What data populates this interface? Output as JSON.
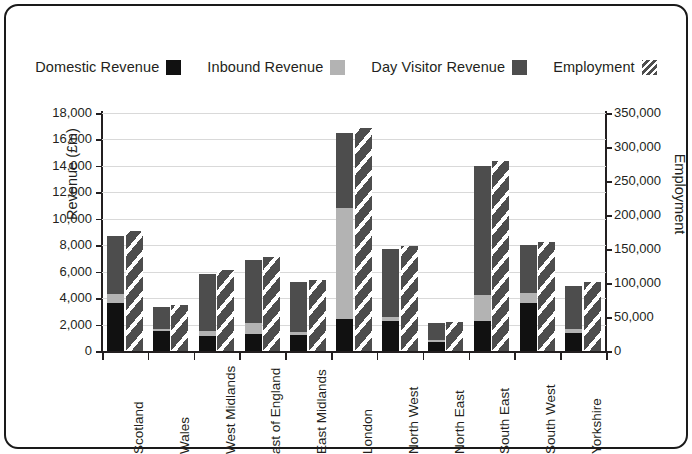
{
  "legend": {
    "items": [
      {
        "label": "Domestic Revenue",
        "swatch": "solid-black-swatch",
        "color": "#111111"
      },
      {
        "label": "Inbound Revenue",
        "swatch": "light-gray-swatch",
        "color": "#b3b3b3"
      },
      {
        "label": "Day Visitor Revenue",
        "swatch": "dark-gray-swatch",
        "color": "#4d4d4d"
      },
      {
        "label": "Employment",
        "swatch": "diagonal-hatch-swatch",
        "color": "#4d4d4d"
      }
    ]
  },
  "chart_data": {
    "type": "bar",
    "title": "",
    "subtype": "stacked-bar-with-secondary-axis",
    "xlabel": "",
    "ylabel": "Revenue (£m)",
    "y2label": "Employment",
    "ylim": [
      0,
      18000
    ],
    "y2lim": [
      0,
      350000
    ],
    "grid": true,
    "legend_position": "top",
    "y_ticks": [
      "0",
      "2,000",
      "4,000",
      "6,000",
      "8,000",
      "10,000",
      "12,000",
      "14,000",
      "16,000",
      "18,000"
    ],
    "y_tick_values": [
      0,
      2000,
      4000,
      6000,
      8000,
      10000,
      12000,
      14000,
      16000,
      18000
    ],
    "y2_ticks": [
      "0",
      "50,000",
      "100,000",
      "150,000",
      "200,000",
      "250,000",
      "300,000",
      "350,000"
    ],
    "y2_tick_values": [
      0,
      50000,
      100000,
      150000,
      200000,
      250000,
      300000,
      350000
    ],
    "categories": [
      "Scotland",
      "Wales",
      "West Midlands",
      "ast of England",
      "East Midlands",
      "London",
      "North West",
      "North East",
      "South East",
      "South West",
      "Yorkshire"
    ],
    "series": [
      {
        "name": "Domestic Revenue",
        "axis": "left",
        "stack": "revenue",
        "color": "#111111",
        "values": [
          3600,
          1500,
          1150,
          1300,
          1200,
          2400,
          2300,
          700,
          2300,
          3600,
          1400
        ]
      },
      {
        "name": "Day Visitor Revenue",
        "axis": "left",
        "stack": "revenue",
        "color": "#b3b3b3",
        "values": [
          700,
          200,
          400,
          800,
          250,
          8400,
          300,
          150,
          1900,
          800,
          250
        ]
      },
      {
        "name": "Inbound Revenue",
        "axis": "left",
        "stack": "revenue",
        "color": "#4d4d4d",
        "values": [
          4400,
          1650,
          4250,
          4800,
          3750,
          5700,
          5100,
          1250,
          9800,
          3600,
          3250
        ]
      },
      {
        "name": "Employment",
        "axis": "right",
        "stack": "employment",
        "color": "#4d4d4d",
        "values": [
          176000,
          68000,
          119000,
          138000,
          105000,
          328000,
          155000,
          43000,
          280000,
          161000,
          101000
        ]
      }
    ],
    "revenue_totals": [
      8700,
      3350,
      5800,
      6900,
      5200,
      16500,
      7700,
      2100,
      14000,
      8000,
      4900
    ]
  }
}
